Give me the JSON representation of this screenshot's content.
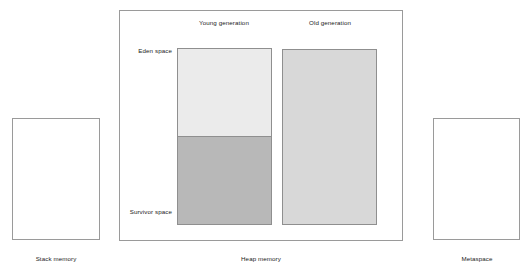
{
  "diagram": {
    "regions": {
      "stack_memory": {
        "label": "Stack memory",
        "fill": "#ffffff",
        "border": "#9a9a9a"
      },
      "heap_memory": {
        "label": "Heap memory",
        "fill": "#ffffff",
        "border": "#9a9a9a",
        "columns": [
          {
            "name": "young-generation",
            "label": "Young generation",
            "subregions": [
              {
                "name": "eden-space",
                "label": "Eden space",
                "fill": "#ebebeb",
                "border": "#8f8f8f"
              },
              {
                "name": "survivor-space",
                "label": "Survivor space",
                "fill": "#b8b8b8",
                "border": "#8f8f8f"
              }
            ]
          },
          {
            "name": "old-generation",
            "label": "Old generation",
            "fill": "#d8d8d8",
            "border": "#8f8f8f"
          }
        ]
      },
      "metaspace": {
        "label": "Metaspace",
        "fill": "#ffffff",
        "border": "#9a9a9a"
      }
    }
  }
}
